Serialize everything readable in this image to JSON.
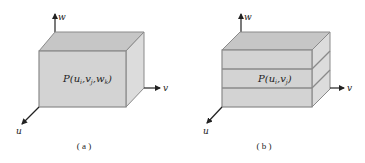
{
  "figure": {
    "panels": [
      {
        "id": "a",
        "caption": "( a )",
        "point_label": "P(u",
        "point_label_full": "P(u_i,v_j,w_k)",
        "label_parts": [
          {
            "t": "P(u",
            "sub": false
          },
          {
            "t": "i",
            "sub": true
          },
          {
            "t": ",v",
            "sub": false
          },
          {
            "t": "j",
            "sub": true
          },
          {
            "t": ",w",
            "sub": false
          },
          {
            "t": "k",
            "sub": true
          },
          {
            "t": ")",
            "sub": false
          }
        ],
        "layers": 1,
        "axes": {
          "u": "u",
          "v": "v",
          "w": "w"
        }
      },
      {
        "id": "b",
        "caption": "( b )",
        "point_label_full": "P(u_i,v_j)",
        "label_parts": [
          {
            "t": "P(u",
            "sub": false
          },
          {
            "t": "i",
            "sub": true
          },
          {
            "t": ",v",
            "sub": false
          },
          {
            "t": "j",
            "sub": true
          },
          {
            "t": ")",
            "sub": false
          }
        ],
        "layers": 3,
        "axes": {
          "u": "u",
          "v": "v",
          "w": "w"
        }
      }
    ],
    "colors": {
      "front_face": "#d2d2d2",
      "top_face": "#c4c4c4",
      "side_face": "#dadada",
      "edge": "#8a8a8a",
      "axis": "#222222"
    }
  }
}
